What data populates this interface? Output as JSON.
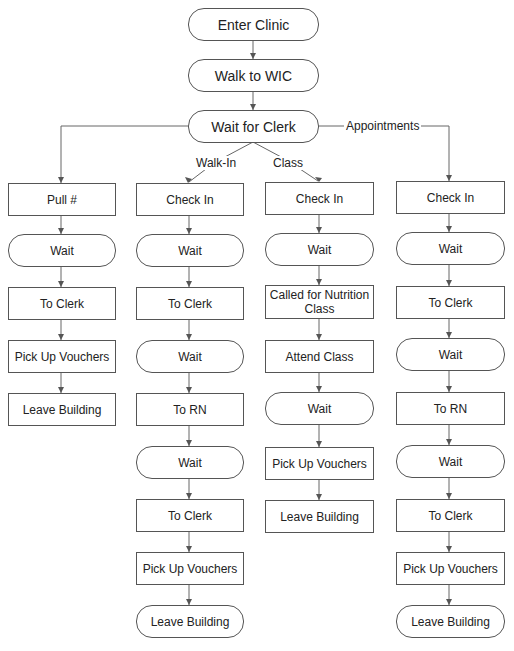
{
  "diagram": {
    "top": [
      {
        "id": "enter",
        "label": "Enter Clinic",
        "shape": "terminal"
      },
      {
        "id": "walk",
        "label": "Walk to WIC",
        "shape": "terminal"
      },
      {
        "id": "waitclerk",
        "label": "Wait for Clerk",
        "shape": "terminal"
      }
    ],
    "branch_labels": {
      "walk_in": "Walk-In",
      "class": "Class",
      "appointments": "Appointments"
    },
    "columns": [
      {
        "name": "pull-number",
        "steps": [
          {
            "label": "Pull #",
            "shape": "process"
          },
          {
            "label": "Wait",
            "shape": "terminal"
          },
          {
            "label": "To Clerk",
            "shape": "process"
          },
          {
            "label": "Pick Up Vouchers",
            "shape": "process"
          },
          {
            "label": "Leave Building",
            "shape": "process"
          }
        ]
      },
      {
        "name": "walk-in",
        "steps": [
          {
            "label": "Check In",
            "shape": "process"
          },
          {
            "label": "Wait",
            "shape": "terminal"
          },
          {
            "label": "To Clerk",
            "shape": "process"
          },
          {
            "label": "Wait",
            "shape": "terminal"
          },
          {
            "label": "To RN",
            "shape": "process"
          },
          {
            "label": "Wait",
            "shape": "terminal"
          },
          {
            "label": "To Clerk",
            "shape": "process"
          },
          {
            "label": "Pick Up Vouchers",
            "shape": "process"
          },
          {
            "label": "Leave Building",
            "shape": "terminal"
          }
        ]
      },
      {
        "name": "class",
        "steps": [
          {
            "label": "Check In",
            "shape": "process"
          },
          {
            "label": "Wait",
            "shape": "terminal"
          },
          {
            "label": "Called for Nutrition Class",
            "shape": "process"
          },
          {
            "label": "Attend Class",
            "shape": "process"
          },
          {
            "label": "Wait",
            "shape": "terminal"
          },
          {
            "label": "Pick Up Vouchers",
            "shape": "process"
          },
          {
            "label": "Leave Building",
            "shape": "process"
          }
        ]
      },
      {
        "name": "appointments",
        "steps": [
          {
            "label": "Check In",
            "shape": "process"
          },
          {
            "label": "Wait",
            "shape": "terminal"
          },
          {
            "label": "To Clerk",
            "shape": "process"
          },
          {
            "label": "Wait",
            "shape": "terminal"
          },
          {
            "label": "To RN",
            "shape": "process"
          },
          {
            "label": "Wait",
            "shape": "terminal"
          },
          {
            "label": "To Clerk",
            "shape": "process"
          },
          {
            "label": "Pick Up Vouchers",
            "shape": "process"
          },
          {
            "label": "Leave Building",
            "shape": "terminal"
          }
        ]
      }
    ]
  }
}
